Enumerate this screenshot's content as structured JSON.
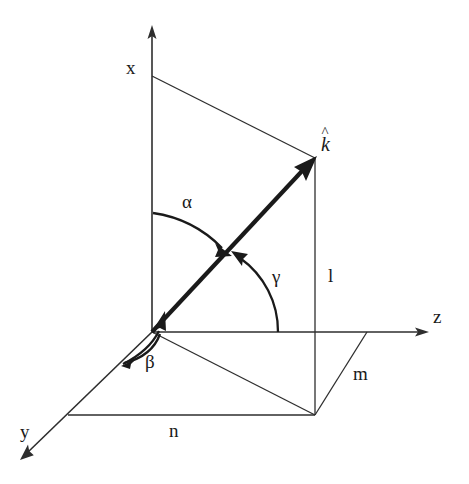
{
  "figure": {
    "type": "3d-vector-direction-cosines-diagram",
    "background_color": "#ffffff",
    "line_color": "#2e2e2e",
    "vector_color": "#1a1a1a",
    "width": 469,
    "height": 484
  },
  "labels": {
    "axis_x": "x",
    "axis_y": "y",
    "axis_z": "z",
    "vector": "k",
    "vector_hat": "^",
    "angle_alpha": "α",
    "angle_beta": "β",
    "angle_gamma": "γ",
    "component_l": "l",
    "component_m": "m",
    "component_n": "n"
  },
  "geometry": {
    "origin": {
      "x": 152,
      "y": 332
    },
    "x_axis_tip": {
      "x": 152,
      "y": 27
    },
    "y_axis_tip": {
      "x": 22,
      "y": 458
    },
    "z_axis_tip": {
      "x": 427,
      "y": 332
    },
    "vector_tip": {
      "x": 315,
      "y": 158
    },
    "foot_point": {
      "x": 315,
      "y": 415
    },
    "x_axis_corner": {
      "x": 152,
      "y": 76
    },
    "y_axis_corner": {
      "x": 68,
      "y": 415
    },
    "z_axis_corner": {
      "x": 367,
      "y": 332
    },
    "alpha_arc": {
      "start_x": 153,
      "start_y": 213,
      "end_x": 228,
      "end_y": 252
    },
    "beta_arc": {
      "start_x": 125,
      "start_y": 362,
      "end_x": 162,
      "end_y": 313
    },
    "gamma_arc": {
      "start_x": 278,
      "start_y": 332,
      "end_x": 233,
      "end_y": 253
    }
  },
  "label_positions": {
    "axis_x": {
      "left": 126,
      "top": 58
    },
    "axis_y": {
      "left": 20,
      "top": 422
    },
    "axis_z": {
      "left": 433,
      "top": 307
    },
    "vector": {
      "left": 321,
      "top": 134
    },
    "angle_alpha": {
      "left": 182,
      "top": 192
    },
    "angle_beta": {
      "left": 145,
      "top": 352
    },
    "angle_gamma": {
      "left": 272,
      "top": 267
    },
    "component_l": {
      "left": 328,
      "top": 266
    },
    "component_m": {
      "left": 353,
      "top": 364
    },
    "component_n": {
      "left": 169,
      "top": 421
    }
  }
}
